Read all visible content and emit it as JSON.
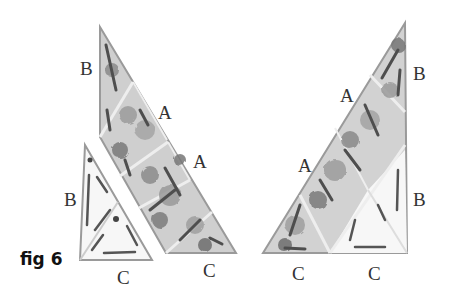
{
  "figure": {
    "caption": "fig 6"
  },
  "left_group": {
    "labels": [
      {
        "id": "b1",
        "text": "B"
      },
      {
        "id": "a1",
        "text": "A"
      },
      {
        "id": "a2",
        "text": "A"
      },
      {
        "id": "b2",
        "text": "B"
      },
      {
        "id": "c1",
        "text": "C"
      },
      {
        "id": "c2",
        "text": "C"
      }
    ]
  },
  "right_group": {
    "labels": [
      {
        "id": "b1",
        "text": "B"
      },
      {
        "id": "a1",
        "text": "A"
      },
      {
        "id": "a2",
        "text": "A"
      },
      {
        "id": "b2",
        "text": "B"
      },
      {
        "id": "c1",
        "text": "C"
      },
      {
        "id": "c2",
        "text": "C"
      }
    ]
  },
  "colors": {
    "outline": "#9a9a9a",
    "fabric_light": "#d4d4d4",
    "fabric_mid": "#a8a8a8",
    "fabric_dark": "#555555",
    "plain_fill": "#f7f7f7"
  }
}
